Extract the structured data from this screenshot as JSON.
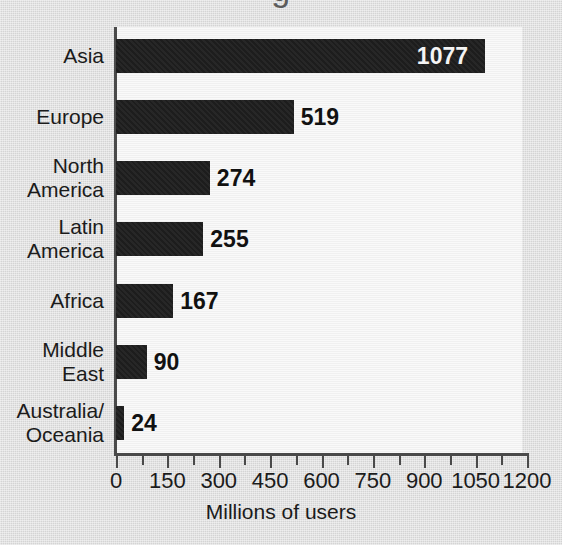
{
  "page": {
    "background_color": "#dcdcdc",
    "plot_background_color": "#f3f3f3",
    "bar_color": "#1d1d1d",
    "axis_color": "#4a4a4a",
    "clipped_title_fragment": "g"
  },
  "chart_data": {
    "type": "bar",
    "orientation": "horizontal",
    "title": "",
    "subtitle": "",
    "xlabel": "Millions of users",
    "ylabel": "",
    "xlim": [
      0,
      1200
    ],
    "grid": false,
    "legend": null,
    "categories": [
      "Asia",
      "Europe",
      "North\nAmerica",
      "Latin\nAmerica",
      "Africa",
      "Middle\nEast",
      "Australia/\nOceania"
    ],
    "values": [
      1077,
      519,
      274,
      255,
      167,
      90,
      24
    ],
    "value_labels": [
      "1077",
      "519",
      "274",
      "255",
      "167",
      "90",
      "24"
    ],
    "value_label_placement": [
      "inside",
      "outside",
      "outside",
      "outside",
      "outside",
      "outside",
      "outside"
    ],
    "xticks": [
      0,
      150,
      300,
      450,
      600,
      750,
      900,
      1050,
      1200
    ],
    "xtick_labels": [
      "0",
      "150",
      "300",
      "450",
      "600",
      "750",
      "900",
      "1050",
      "1200"
    ],
    "minor_tick_interval": 75
  }
}
